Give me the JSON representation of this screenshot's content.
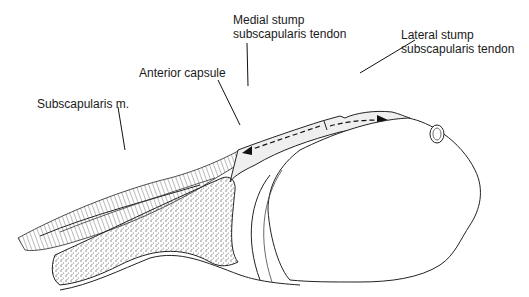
{
  "figure": {
    "labels": {
      "medial_stump": {
        "line1": "Medial stump",
        "line2": "subscapularis tendon"
      },
      "lateral_stump": {
        "line1": "Lateral stump",
        "line2": "subscapularis tendon"
      },
      "anterior_capsule": {
        "text": "Anterior capsule"
      },
      "subscapularis_muscle": {
        "text": "Subscapularis m."
      }
    },
    "colors": {
      "ink": "#1a1a1a",
      "hatch": "#555555",
      "bone_stipple": "#6b6b6b",
      "background": "#ffffff"
    }
  }
}
